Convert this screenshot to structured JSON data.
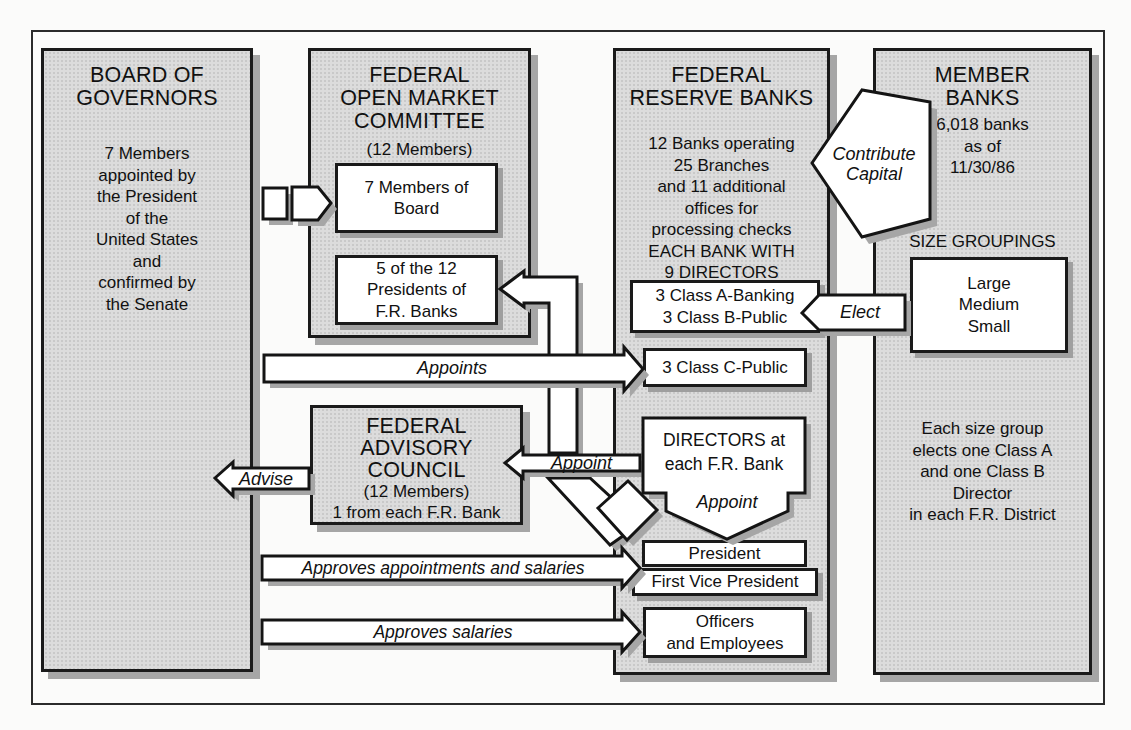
{
  "colors": {
    "box_fill": "#dcdcdc",
    "border": "#1a1a1a",
    "shadow": "#a6a6a6",
    "background": "#fbfbfa"
  },
  "boxes": {
    "board_of_governors": {
      "title": "BOARD OF\nGOVERNORS",
      "body": "7 Members\nappointed by\nthe President\nof the\nUnited States\nand\nconfirmed by\nthe Senate"
    },
    "fomc": {
      "title": "FEDERAL\nOPEN MARKET\nCOMMITTEE",
      "subtitle": "(12 Members)",
      "members_box": "7 Members of\nBoard",
      "presidents_box": "5 of the 12\nPresidents of\nF.R. Banks"
    },
    "federal_reserve_banks": {
      "title": "FEDERAL\nRESERVE BANKS",
      "body": "12 Banks operating\n25 Branches\nand 11 additional\noffices for\nprocessing checks\nEACH BANK WITH\n9 DIRECTORS",
      "class_ab_box": "3 Class A-Banking\n3 Class B-Public",
      "class_c_box": "3 Class C-Public",
      "directors_box": "DIRECTORS at\neach F.R. Bank",
      "directors_appoint_label": "Appoint",
      "president_box": "President",
      "first_vice_president_box": "First Vice President",
      "officers_box": "Officers\nand Employees"
    },
    "member_banks": {
      "title": "MEMBER\nBANKS",
      "body": "6,018 banks\nas of\n11/30/86",
      "size_groupings_label": "SIZE GROUPINGS",
      "size_box": "Large\nMedium\nSmall",
      "footer": "Each size group\nelects one Class A\nand one Class B\nDirector\nin each F.R. District"
    },
    "federal_advisory_council": {
      "title": "FEDERAL\nADVISORY\nCOUNCIL",
      "subtitle": "(12 Members)",
      "line": "1 from each F.R. Bank"
    }
  },
  "arrows": {
    "appoints": "Appoints",
    "appoint_fac": "Appoint",
    "advise": "Advise",
    "contribute_capital": "Contribute\nCapital",
    "elect": "Elect",
    "approves_appointments": "Approves appointments and salaries",
    "approves_salaries": "Approves salaries"
  }
}
